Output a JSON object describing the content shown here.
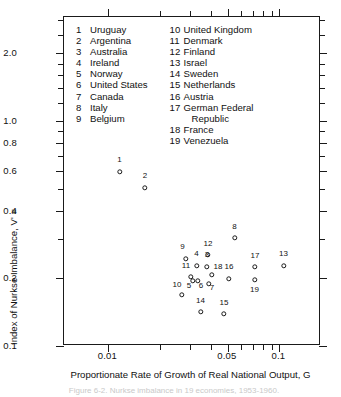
{
  "figure": {
    "caption": "Figure 6-2. Nurkse imbalance in 19 economies, 1953-1960."
  },
  "chart_data": {
    "type": "scatter",
    "title": "",
    "xlabel": "Proportionate Rate of Growth of Real National Output, G",
    "ylabel": "Index of Nurkse Imbalance, V'",
    "ylabel_formula_parts": {
      "identity": "≡",
      "prefix": "1",
      "denominator": "G",
      "radical": "√",
      "sum_upper": "n",
      "sum_symbol": "Σ",
      "sum_lower": "i = 1",
      "term": "ωᵢ(gₓᵢ − EᵢG)²"
    },
    "xscale": "log",
    "yscale": "log",
    "xlim": [
      0.0055,
      0.175
    ],
    "ylim": [
      0.1,
      2.9
    ],
    "grid": false,
    "xticks": [
      0.01,
      0.05,
      0.1
    ],
    "xticklabels": [
      "0.01",
      "0.05",
      "0.1"
    ],
    "xminorticks": [
      0.02,
      0.03,
      0.04,
      0.06,
      0.07,
      0.08,
      0.09
    ],
    "yticks": [
      0.1,
      0.2,
      0.4,
      0.6,
      0.8,
      1.0,
      2.0
    ],
    "yticklabels": [
      "0.1",
      "0.2",
      "0.4",
      "0.6",
      "0.8",
      "1.0",
      "2.0"
    ],
    "yminorticks": [
      0.3,
      0.5,
      0.7,
      0.9,
      1.2,
      1.4,
      1.6,
      1.8,
      2.4,
      2.8
    ],
    "marker": "open-circle",
    "points": [
      {
        "id": 1,
        "label": "1",
        "country": "Uruguay",
        "x": 0.0108,
        "y": 0.96,
        "px": 118.5,
        "py": 170.5,
        "lx": 118.5,
        "ly": 163.0
      },
      {
        "id": 2,
        "label": "2",
        "country": "Argentina",
        "x": 0.0163,
        "y": 0.77,
        "px": 144.0,
        "py": 186.5,
        "lx": 144.0,
        "ly": 179.0
      },
      {
        "id": 3,
        "label": "3",
        "country": "Australia",
        "x": 0.0452,
        "y": 0.34,
        "px": 206.0,
        "py": 265.5,
        "lx": 206.0,
        "ly": 258.0
      },
      {
        "id": 4,
        "label": "4",
        "country": "Ireland",
        "x": 0.0378,
        "y": 0.345,
        "px": 195.5,
        "py": 264.5,
        "lx": 195.5,
        "ly": 257.0
      },
      {
        "id": 5,
        "label": "5",
        "country": "Norway",
        "x": 0.0356,
        "y": 0.278,
        "px": 192.0,
        "py": 279.5,
        "lx": 188.0,
        "ly": 288.5
      },
      {
        "id": 6,
        "label": "6",
        "country": "United States",
        "x": 0.0384,
        "y": 0.277,
        "px": 196.5,
        "py": 280.0,
        "lx": 200.0,
        "ly": 288.5
      },
      {
        "id": 7,
        "label": "7",
        "country": "Canada",
        "x": 0.0462,
        "y": 0.268,
        "px": 207.5,
        "py": 282.5,
        "lx": 211.0,
        "ly": 291.0
      },
      {
        "id": 8,
        "label": "8",
        "country": "Italy",
        "x": 0.0597,
        "y": 0.525,
        "px": 233.5,
        "py": 237.0,
        "lx": 233.5,
        "ly": 229.5
      },
      {
        "id": 9,
        "label": "9",
        "country": "Belgium",
        "x": 0.0318,
        "y": 0.383,
        "px": 184.5,
        "py": 257.5,
        "lx": 181.5,
        "ly": 250.0
      },
      {
        "id": 10,
        "label": "10",
        "country": "United Kingdom",
        "x": 0.0302,
        "y": 0.224,
        "px": 181.0,
        "py": 294.0,
        "lx": 176.0,
        "ly": 287.5
      },
      {
        "id": 11,
        "label": "11",
        "country": "Denmark",
        "x": 0.0345,
        "y": 0.295,
        "px": 190.0,
        "py": 276.0,
        "lx": 185.0,
        "ly": 269.0
      },
      {
        "id": 12,
        "label": "12",
        "country": "Finland",
        "x": 0.0458,
        "y": 0.398,
        "px": 207.0,
        "py": 254.0,
        "lx": 207.0,
        "ly": 246.5
      },
      {
        "id": 13,
        "label": "13",
        "country": "Israel",
        "x": 0.113,
        "y": 0.345,
        "px": 282.5,
        "py": 264.5,
        "lx": 282.5,
        "ly": 257.0
      },
      {
        "id": 14,
        "label": "14",
        "country": "Sweden",
        "x": 0.0402,
        "y": 0.181,
        "px": 199.5,
        "py": 311.0,
        "lx": 199.5,
        "ly": 303.5
      },
      {
        "id": 15,
        "label": "15",
        "country": "Netherlands",
        "x": 0.0513,
        "y": 0.177,
        "px": 223.0,
        "py": 313.0,
        "lx": 223.0,
        "ly": 305.5
      },
      {
        "id": 16,
        "label": "16",
        "country": "Austria",
        "x": 0.0564,
        "y": 0.287,
        "px": 228.0,
        "py": 278.0,
        "lx": 228.0,
        "ly": 270.0
      },
      {
        "id": 17,
        "label": "17",
        "country": "German Federal Republic",
        "x": 0.0776,
        "y": 0.338,
        "px": 254.0,
        "py": 266.0,
        "lx": 254.0,
        "ly": 258.5
      },
      {
        "id": 18,
        "label": "18",
        "country": "France",
        "x": 0.0484,
        "y": 0.302,
        "px": 211.0,
        "py": 274.0,
        "lx": 217.0,
        "ly": 270.0
      },
      {
        "id": 19,
        "label": "19",
        "country": "Venezuela",
        "x": 0.0772,
        "y": 0.283,
        "px": 253.5,
        "py": 279.0,
        "lx": 253.5,
        "ly": 292.5
      }
    ]
  },
  "legend": {
    "columns": [
      {
        "items": [
          {
            "num": "1",
            "name": "Uruguay"
          },
          {
            "num": "2",
            "name": "Argentina"
          },
          {
            "num": "3",
            "name": "Australia"
          },
          {
            "num": "4",
            "name": "Ireland"
          },
          {
            "num": "5",
            "name": "Norway"
          },
          {
            "num": "6",
            "name": "United States"
          },
          {
            "num": "7",
            "name": "Canada"
          },
          {
            "num": "8",
            "name": "Italy"
          },
          {
            "num": "9",
            "name": "Belgium"
          }
        ]
      },
      {
        "items": [
          {
            "num": "10",
            "name": "United Kingdom"
          },
          {
            "num": "11",
            "name": "Denmark"
          },
          {
            "num": "12",
            "name": "Finland"
          },
          {
            "num": "13",
            "name": "Israel"
          },
          {
            "num": "14",
            "name": "Sweden"
          },
          {
            "num": "15",
            "name": "Netherlands"
          },
          {
            "num": "16",
            "name": "Austria"
          },
          {
            "num": "17",
            "name": "German Federal",
            "continuation": "Republic"
          },
          {
            "num": "18",
            "name": "France"
          },
          {
            "num": "19",
            "name": "Venezuela"
          }
        ]
      }
    ]
  }
}
